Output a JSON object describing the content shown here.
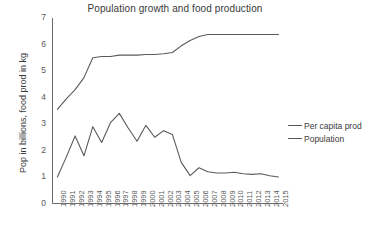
{
  "chart_data": {
    "type": "line",
    "title": "Population growth and food production",
    "xlabel": "",
    "ylabel": "Pop in billions, food prod in kg",
    "ylim": [
      0,
      7
    ],
    "yticks": [
      0,
      1,
      2,
      3,
      4,
      5,
      6,
      7
    ],
    "grid": false,
    "legend_position": "right",
    "categories": [
      "1990",
      "1991",
      "1992",
      "1993",
      "1994",
      "1995",
      "1996",
      "1997",
      "1998",
      "1999",
      "2000",
      "2001",
      "2002",
      "2003",
      "2004",
      "2005",
      "2006",
      "2007",
      "2008",
      "2009",
      "2010",
      "2011",
      "2012",
      "2013",
      "2014",
      "2015"
    ],
    "series": [
      {
        "name": "Per capita prod",
        "color": "#5a5a5a",
        "values": [
          3.55,
          3.95,
          4.3,
          4.75,
          5.5,
          5.55,
          5.55,
          5.6,
          5.6,
          5.6,
          5.62,
          5.62,
          5.65,
          5.7,
          5.95,
          6.15,
          6.3,
          6.38,
          6.38,
          6.38,
          6.38,
          6.38,
          6.38,
          6.38,
          6.38,
          6.38
        ]
      },
      {
        "name": "Population",
        "color": "#5a5a5a",
        "values": [
          1.0,
          1.75,
          2.55,
          1.8,
          2.9,
          2.3,
          3.05,
          3.4,
          2.85,
          2.35,
          2.95,
          2.5,
          2.75,
          2.6,
          1.55,
          1.05,
          1.35,
          1.2,
          1.15,
          1.15,
          1.18,
          1.12,
          1.1,
          1.12,
          1.05,
          1.0
        ]
      }
    ],
    "legend": [
      "Per capita prod",
      "Population"
    ]
  },
  "axes": {
    "y_tick_labels": [
      "7",
      "6",
      "5",
      "4",
      "3",
      "2",
      "1",
      "0"
    ],
    "x_tick_labels": [
      "1990",
      "1991",
      "1992",
      "1993",
      "1994",
      "1995",
      "1996",
      "1997",
      "1998",
      "1999",
      "2000",
      "2001",
      "2002",
      "2003",
      "2004",
      "2005",
      "2006",
      "2007",
      "2008",
      "2009",
      "2010",
      "2011",
      "2012",
      "2013",
      "2014",
      "2015"
    ]
  }
}
